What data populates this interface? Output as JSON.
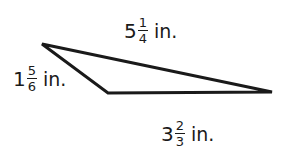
{
  "diagram": {
    "shape": "triangle",
    "stroke_color": "#1a1a1a",
    "vertices": [
      [
        42,
        44
      ],
      [
        108,
        93
      ],
      [
        272,
        92
      ]
    ],
    "sides": {
      "top": {
        "whole": "5",
        "numerator": "1",
        "denominator": "4",
        "unit": "in."
      },
      "left": {
        "whole": "1",
        "numerator": "5",
        "denominator": "6",
        "unit": "in."
      },
      "bottom": {
        "whole": "3",
        "numerator": "2",
        "denominator": "3",
        "unit": "in."
      }
    }
  }
}
